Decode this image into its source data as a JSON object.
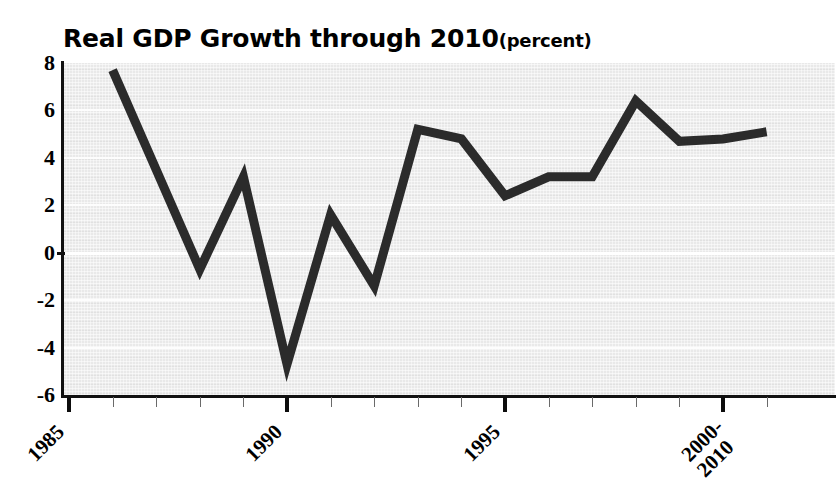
{
  "chart_data": {
    "type": "line",
    "title": "Real GDP Growth through 2010",
    "title_unit": "(percent)",
    "xlabel": "",
    "ylabel": "",
    "ylim": [
      -6,
      8
    ],
    "xlim": [
      1985,
      2001
    ],
    "yticks": [
      "8",
      "6",
      "4",
      "2",
      "0",
      "-2",
      "-4",
      "-6"
    ],
    "ytick_values": [
      8,
      6,
      4,
      2,
      0,
      -2,
      -4,
      -6
    ],
    "xtick_labels": [
      "1985",
      "1990",
      "1995",
      "2000-\n2010"
    ],
    "xtick_values": [
      1985,
      1990,
      1995,
      2000
    ],
    "grid": "horizontal",
    "legend": "none",
    "line_color": "#2b2b2b",
    "plot_background": "#e9e9e9",
    "gridline_color": "#fdfdfd",
    "x": [
      1986,
      1987,
      1988,
      1989,
      1990,
      1991,
      1992,
      1993,
      1994,
      1995,
      1996,
      1997,
      1998,
      1999,
      2000,
      2001
    ],
    "values": [
      7.7,
      3.5,
      -0.7,
      3.2,
      -4.7,
      1.6,
      -1.4,
      5.2,
      4.8,
      2.4,
      3.2,
      3.2,
      6.4,
      4.7,
      4.8,
      5.1
    ],
    "series": [
      {
        "name": "Real GDP Growth",
        "values": [
          7.7,
          3.5,
          -0.7,
          3.2,
          -4.7,
          1.6,
          -1.4,
          5.2,
          4.8,
          2.4,
          3.2,
          3.2,
          6.4,
          4.7,
          4.8,
          5.1
        ]
      }
    ]
  }
}
